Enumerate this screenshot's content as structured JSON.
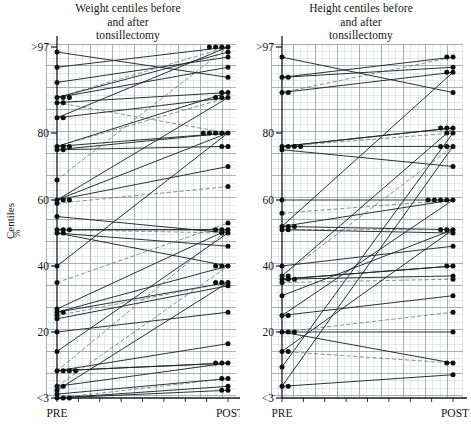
{
  "figure": {
    "caption_y_axis": "Centiles",
    "caption_y_axis_unit": "%",
    "background": "#ffffff",
    "ink_color": "#1a1a1a",
    "grid_color": "#9aa0a8",
    "grid_minor_color": "#c8ccd2"
  },
  "panels": [
    {
      "id": "weight",
      "title": "Weight centiles before\nand after\ntonsillectomy",
      "ylabel": "Centiles %",
      "xticks": [
        "PRE",
        "POST"
      ]
    },
    {
      "id": "height",
      "title": "Height centiles before\nand after\ntonsillectomy",
      "ylabel": "Centiles %",
      "xticks": [
        "PRE",
        "POST"
      ]
    }
  ],
  "chart_data": [
    {
      "type": "line",
      "id": "weight-slopegraph",
      "title": "Weight centiles before and after tonsillectomy",
      "subtitle": "",
      "xlabel": "",
      "ylabel": "Centiles %",
      "x": [
        "PRE",
        "POST"
      ],
      "ytick_values": [
        97,
        80,
        60,
        40,
        20,
        3
      ],
      "ytick_labels": [
        ">97",
        "80",
        "60",
        "40",
        "20",
        "<3"
      ],
      "ylim": [
        3,
        97
      ],
      "grid": true,
      "legend": "none",
      "note": "Each series is one patient: centile before (PRE) and after (POST) tonsillectomy.",
      "series": [
        {
          "name": "p01",
          "values": [
            96,
            91
          ]
        },
        {
          "name": "p02",
          "values": [
            93,
            97
          ]
        },
        {
          "name": "p03",
          "values": [
            90,
            95
          ]
        },
        {
          "name": "p04",
          "values": [
            87,
            97
          ]
        },
        {
          "name": "p05",
          "values": [
            87,
            96
          ]
        },
        {
          "name": "p06",
          "values": [
            87,
            93
          ]
        },
        {
          "name": "p07",
          "values": [
            86,
            88
          ]
        },
        {
          "name": "p08",
          "values": [
            86,
            80
          ]
        },
        {
          "name": "p09",
          "values": [
            83,
            97
          ]
        },
        {
          "name": "p10",
          "values": [
            83,
            87
          ]
        },
        {
          "name": "p11",
          "values": [
            76,
            88
          ]
        },
        {
          "name": "p12",
          "values": [
            76,
            87
          ]
        },
        {
          "name": "p13",
          "values": [
            76,
            80
          ]
        },
        {
          "name": "p14",
          "values": [
            75,
            80
          ]
        },
        {
          "name": "p15",
          "values": [
            75,
            76
          ]
        },
        {
          "name": "p16",
          "values": [
            66,
            97
          ]
        },
        {
          "name": "p17",
          "values": [
            60,
            87
          ]
        },
        {
          "name": "p18",
          "values": [
            60,
            80
          ]
        },
        {
          "name": "p19",
          "values": [
            60,
            70
          ]
        },
        {
          "name": "p20",
          "values": [
            59,
            64
          ]
        },
        {
          "name": "p21",
          "values": [
            55,
            50
          ]
        },
        {
          "name": "p22",
          "values": [
            51,
            51
          ]
        },
        {
          "name": "p23",
          "values": [
            51,
            51
          ]
        },
        {
          "name": "p24",
          "values": [
            51,
            50
          ]
        },
        {
          "name": "p25",
          "values": [
            50,
            46
          ]
        },
        {
          "name": "p26",
          "values": [
            50,
            40
          ]
        },
        {
          "name": "p27",
          "values": [
            40,
            80
          ]
        },
        {
          "name": "p28",
          "values": [
            35,
            53
          ]
        },
        {
          "name": "p29",
          "values": [
            27,
            51
          ]
        },
        {
          "name": "p30",
          "values": [
            26,
            40
          ]
        },
        {
          "name": "p31",
          "values": [
            26,
            35
          ]
        },
        {
          "name": "p32",
          "values": [
            25,
            35
          ]
        },
        {
          "name": "p33",
          "values": [
            24,
            34
          ]
        },
        {
          "name": "p34",
          "values": [
            20,
            26
          ]
        },
        {
          "name": "p35",
          "values": [
            15,
            50
          ]
        },
        {
          "name": "p36",
          "values": [
            10,
            51
          ]
        },
        {
          "name": "p37",
          "values": [
            10,
            17
          ]
        },
        {
          "name": "p38",
          "values": [
            10,
            12
          ]
        },
        {
          "name": "p39",
          "values": [
            10,
            12
          ]
        },
        {
          "name": "p40",
          "values": [
            6,
            40
          ]
        },
        {
          "name": "p41",
          "values": [
            6,
            12
          ]
        },
        {
          "name": "p42",
          "values": [
            5,
            35
          ]
        },
        {
          "name": "p43",
          "values": [
            4,
            8
          ]
        },
        {
          "name": "p44",
          "values": [
            3,
            8
          ]
        },
        {
          "name": "p45",
          "values": [
            3,
            6
          ]
        },
        {
          "name": "p46",
          "values": [
            3,
            5
          ]
        }
      ],
      "pre_points": [
        96,
        93,
        90,
        87,
        87,
        87,
        86,
        86,
        83,
        83,
        76,
        76,
        76,
        75,
        75,
        66,
        60,
        60,
        60,
        59,
        55,
        51,
        51,
        51,
        50,
        50,
        40,
        35,
        27,
        26,
        26,
        25,
        24,
        20,
        15,
        10,
        10,
        10,
        10,
        6,
        6,
        5,
        4,
        3,
        3,
        3
      ],
      "post_points": [
        97,
        97,
        97,
        97,
        96,
        95,
        93,
        91,
        88,
        88,
        87,
        87,
        87,
        80,
        80,
        80,
        80,
        80,
        76,
        76,
        70,
        64,
        53,
        51,
        51,
        51,
        50,
        50,
        46,
        40,
        40,
        40,
        35,
        35,
        35,
        34,
        26,
        17,
        12,
        12,
        12,
        8,
        8,
        6,
        5,
        5
      ]
    },
    {
      "type": "line",
      "id": "height-slopegraph",
      "title": "Height centiles before and after tonsillectomy",
      "subtitle": "",
      "xlabel": "",
      "ylabel": "Centiles %",
      "x": [
        "PRE",
        "POST"
      ],
      "ytick_values": [
        97,
        80,
        60,
        40,
        20,
        3
      ],
      "ytick_labels": [
        ">97",
        "80",
        "60",
        "40",
        "20",
        "<3"
      ],
      "ylim": [
        3,
        97
      ],
      "grid": true,
      "legend": "none",
      "note": "Each series is one patient: centile before (PRE) and after (POST) tonsillectomy.",
      "series": [
        {
          "name": "h01",
          "values": [
            95,
            88
          ]
        },
        {
          "name": "h02",
          "values": [
            91,
            95
          ]
        },
        {
          "name": "h03",
          "values": [
            91,
            93
          ]
        },
        {
          "name": "h04",
          "values": [
            88,
            95
          ]
        },
        {
          "name": "h05",
          "values": [
            88,
            92
          ]
        },
        {
          "name": "h06",
          "values": [
            76,
            81
          ]
        },
        {
          "name": "h07",
          "values": [
            76,
            81
          ]
        },
        {
          "name": "h08",
          "values": [
            76,
            80
          ]
        },
        {
          "name": "h09",
          "values": [
            76,
            76
          ]
        },
        {
          "name": "h10",
          "values": [
            75,
            70
          ]
        },
        {
          "name": "h11",
          "values": [
            60,
            60
          ]
        },
        {
          "name": "h12",
          "values": [
            56,
            60
          ]
        },
        {
          "name": "h13",
          "values": [
            52,
            92
          ]
        },
        {
          "name": "h14",
          "values": [
            52,
            60
          ]
        },
        {
          "name": "h15",
          "values": [
            52,
            51
          ]
        },
        {
          "name": "h16",
          "values": [
            51,
            51
          ]
        },
        {
          "name": "h17",
          "values": [
            51,
            50
          ]
        },
        {
          "name": "h18",
          "values": [
            40,
            46
          ]
        },
        {
          "name": "h19",
          "values": [
            37,
            81
          ]
        },
        {
          "name": "h20",
          "values": [
            37,
            76
          ]
        },
        {
          "name": "h21",
          "values": [
            36,
            40
          ]
        },
        {
          "name": "h22",
          "values": [
            36,
            40
          ]
        },
        {
          "name": "h23",
          "values": [
            36,
            37
          ]
        },
        {
          "name": "h24",
          "values": [
            35,
            36
          ]
        },
        {
          "name": "h25",
          "values": [
            31,
            51
          ]
        },
        {
          "name": "h26",
          "values": [
            25,
            60
          ]
        },
        {
          "name": "h27",
          "values": [
            25,
            31
          ]
        },
        {
          "name": "h28",
          "values": [
            20,
            26
          ]
        },
        {
          "name": "h29",
          "values": [
            20,
            20
          ]
        },
        {
          "name": "h30",
          "values": [
            20,
            12
          ]
        },
        {
          "name": "h31",
          "values": [
            15,
            51
          ]
        },
        {
          "name": "h32",
          "values": [
            15,
            12
          ]
        },
        {
          "name": "h33",
          "values": [
            11,
            80
          ]
        },
        {
          "name": "h34",
          "values": [
            6,
            76
          ]
        },
        {
          "name": "h35",
          "values": [
            6,
            9
          ]
        }
      ],
      "pre_points": [
        95,
        91,
        91,
        88,
        88,
        76,
        76,
        76,
        76,
        75,
        60,
        56,
        52,
        52,
        52,
        51,
        51,
        40,
        37,
        37,
        36,
        36,
        36,
        35,
        31,
        25,
        25,
        20,
        20,
        20,
        15,
        15,
        11,
        6,
        6
      ],
      "post_points": [
        95,
        95,
        93,
        92,
        92,
        88,
        81,
        81,
        81,
        80,
        80,
        76,
        76,
        76,
        70,
        60,
        60,
        60,
        60,
        60,
        51,
        51,
        51,
        50,
        46,
        40,
        40,
        37,
        36,
        31,
        26,
        20,
        12,
        12,
        9
      ]
    }
  ]
}
